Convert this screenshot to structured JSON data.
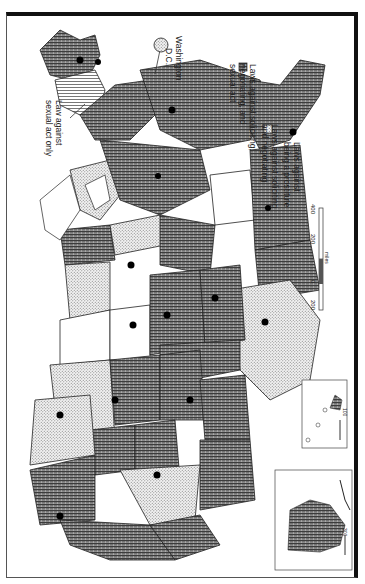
{
  "map": {
    "orientation": "rotated 90 degrees clockwise",
    "subject": "Prostitution laws by U.S. state",
    "callouts": {
      "sexual_act_only": "Law against sexual act only",
      "sexual_act_only_line1": "Law against",
      "sexual_act_only_line2": "sexual act only",
      "dc_line1": "Washington",
      "dc_line2": "D.C."
    },
    "colors": {
      "frame": "#111111",
      "hatch_dark": "#5a5a5a",
      "stipple": "#9a9a9a",
      "dot": "#000000",
      "background": "#ffffff"
    }
  },
  "legend": {
    "items": [
      {
        "pattern": "dense-hatch",
        "label": "Laws against soliciting, negotiating, and sexual act",
        "lines": [
          "Laws against soliciting,",
          "negotiating, and",
          "sexual act"
        ]
      },
      {
        "pattern": "stipple",
        "label": "Laws against soliciting and negotiating",
        "lines": [
          "Laws against soliciting",
          "and negotiating"
        ]
      },
      {
        "pattern": "dot",
        "label": "Laws against being a prostitute",
        "lines": [
          "Laws against",
          "being a prostitute"
        ]
      }
    ]
  },
  "scale_bar": {
    "ticks": [
      "400",
      "200",
      "0",
      "200"
    ],
    "unit": "miles"
  },
  "insets": {
    "alaska": {
      "scale_label": "300",
      "zero": "0"
    },
    "hawaii": {
      "scale_label": "100",
      "zero": "0"
    }
  }
}
